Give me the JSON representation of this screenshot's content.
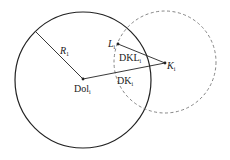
{
  "diagram": {
    "colors": {
      "stroke": "#222222",
      "dashed": "#777777",
      "background": "#ffffff"
    },
    "circles": [
      {
        "name": "main-circle",
        "style": "solid"
      },
      {
        "name": "dashed-circle",
        "style": "dashed"
      }
    ],
    "points": {
      "dol": {
        "label": "Dol",
        "sub": "i"
      },
      "k": {
        "label": "K",
        "sub": "i"
      },
      "l": {
        "label": "L",
        "sub": "i"
      }
    },
    "segments": {
      "radius": {
        "label": "R",
        "sub": "1"
      },
      "dkl": {
        "label": "DKL",
        "sub": "i"
      },
      "dk": {
        "label": "DK",
        "sub": "i"
      }
    }
  }
}
